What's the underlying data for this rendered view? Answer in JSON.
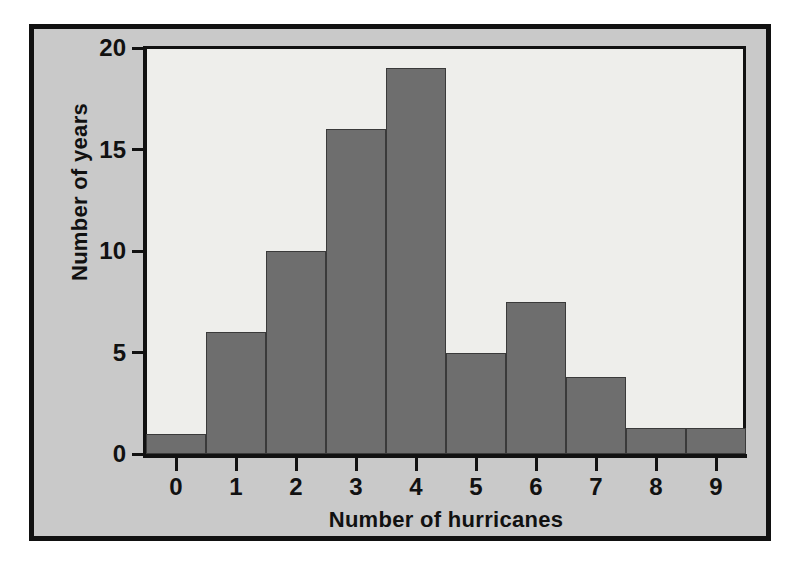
{
  "figure": {
    "background_color": "#ffffff",
    "frame_color": "#111111",
    "panel_color": "#c9c9c9",
    "plot_background_color": "#eeeeeb",
    "bar_color": "#6e6e6e",
    "bar_edge_color": "#3a3a3a"
  },
  "chart_data": {
    "type": "bar",
    "title": "",
    "xlabel": "Number of hurricanes",
    "ylabel": "Number of years",
    "categories": [
      "0",
      "1",
      "2",
      "3",
      "4",
      "5",
      "6",
      "7",
      "8",
      "9"
    ],
    "values": [
      1,
      6,
      10,
      16,
      19,
      5,
      7.5,
      3.8,
      1.3,
      1.3
    ],
    "xlim": [
      -0.5,
      9.5
    ],
    "ylim": [
      0,
      20
    ],
    "yticks": [
      0,
      5,
      10,
      15,
      20
    ],
    "ytick_labels": [
      "0",
      "5",
      "10",
      "15",
      "20"
    ],
    "xticks": [
      0,
      1,
      2,
      3,
      4,
      5,
      6,
      7,
      8,
      9
    ],
    "xtick_labels": [
      "0",
      "1",
      "2",
      "3",
      "4",
      "5",
      "6",
      "7",
      "8",
      "9"
    ],
    "grid": false,
    "legend": null,
    "legend_position": "none",
    "bar_width": 1.0,
    "series": [
      {
        "name": "Number of years",
        "values": [
          1,
          6,
          10,
          16,
          19,
          5,
          7.5,
          3.8,
          1.3,
          1.3
        ]
      }
    ]
  }
}
